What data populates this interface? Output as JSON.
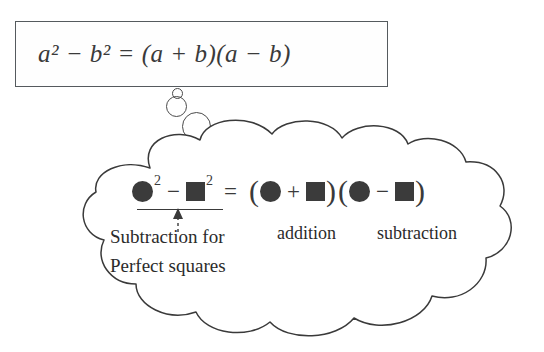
{
  "diagram": {
    "title_equation": "a² − b² = (a + b)(a − b)",
    "formula_box": {
      "equation_text": "a² − b² = (a + b)(a − b)",
      "border_color": "#555a5e"
    },
    "thought_bubbles": [
      {
        "name": "bubble-small",
        "size_px": 11
      },
      {
        "name": "bubble-medium",
        "size_px": 21
      },
      {
        "name": "bubble-large",
        "size_px": 29
      }
    ],
    "cloud": {
      "outline_color": "#3a3a3a",
      "fill_color": "#ffffff",
      "symbolic_equation": {
        "left_side": {
          "term1_shape": "circle",
          "term1_exponent": "2",
          "operator": "−",
          "term2_shape": "square",
          "term2_exponent": "2"
        },
        "equals": "=",
        "right_side": {
          "factor1": {
            "open_paren": "(",
            "shape_a": "circle",
            "operator": "+",
            "shape_b": "square",
            "close_paren": ")"
          },
          "factor2": {
            "open_paren": "(",
            "shape_a": "circle",
            "operator": "−",
            "shape_b": "square",
            "close_paren": ")"
          }
        },
        "shape_fill_color": "#3b3b3b"
      },
      "annotations": {
        "left_label_line1": "Subtraction for",
        "left_label_line2": "Perfect squares",
        "factor1_label": "addition",
        "factor2_label": "subtraction"
      }
    }
  }
}
